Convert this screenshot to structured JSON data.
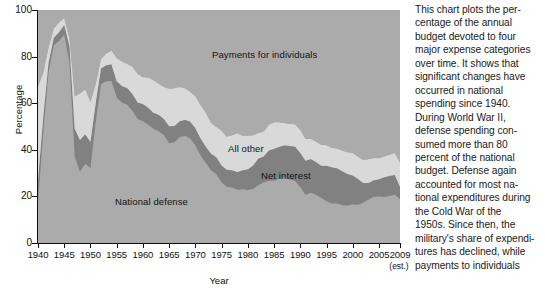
{
  "chart_data": {
    "type": "area",
    "stacked": true,
    "title": "",
    "xlabel": "Year",
    "ylabel": "Percentage",
    "xlim": [
      1940,
      2009
    ],
    "ylim": [
      0,
      100
    ],
    "grid": false,
    "legend_position": "inline-band-labels",
    "y_ticks": [
      0,
      20,
      40,
      60,
      80,
      100
    ],
    "x_ticks": [
      1940,
      1945,
      1950,
      1955,
      1960,
      1965,
      1970,
      1975,
      1980,
      1985,
      1990,
      1995,
      2000,
      2005,
      2009
    ],
    "x_last_tick_note": "(est.)",
    "x": [
      1940,
      1941,
      1942,
      1943,
      1944,
      1945,
      1946,
      1947,
      1948,
      1949,
      1950,
      1951,
      1952,
      1953,
      1954,
      1955,
      1956,
      1957,
      1958,
      1959,
      1960,
      1961,
      1962,
      1963,
      1964,
      1965,
      1966,
      1967,
      1968,
      1969,
      1970,
      1971,
      1972,
      1973,
      1974,
      1975,
      1976,
      1977,
      1978,
      1979,
      1980,
      1981,
      1982,
      1983,
      1984,
      1985,
      1986,
      1987,
      1988,
      1989,
      1990,
      1991,
      1992,
      1993,
      1994,
      1995,
      1996,
      1997,
      1998,
      1999,
      2000,
      2001,
      2002,
      2003,
      2004,
      2005,
      2006,
      2007,
      2008,
      2009
    ],
    "series": [
      {
        "name": "National defense",
        "color": "#ababab",
        "order": 1,
        "values": [
          17.5,
          47.1,
          73.0,
          84.9,
          86.7,
          89.5,
          77.3,
          37.1,
          30.6,
          33.9,
          32.2,
          51.8,
          68.1,
          69.4,
          69.5,
          62.4,
          60.2,
          59.3,
          56.8,
          53.2,
          52.2,
          50.8,
          49.0,
          48.0,
          46.2,
          42.8,
          43.2,
          45.4,
          46.0,
          44.9,
          41.8,
          37.5,
          34.3,
          31.2,
          29.5,
          26.0,
          24.1,
          23.8,
          22.8,
          23.1,
          22.7,
          23.2,
          24.9,
          26.0,
          26.7,
          26.7,
          27.6,
          28.1,
          27.3,
          26.6,
          23.9,
          20.6,
          21.6,
          20.7,
          19.3,
          17.9,
          17.0,
          16.9,
          16.2,
          16.1,
          16.5,
          16.4,
          17.3,
          18.7,
          19.9,
          20.0,
          19.7,
          20.2,
          20.7,
          18.8
        ]
      },
      {
        "name": "Net interest",
        "color": "#818181",
        "order": 2,
        "values": [
          9.5,
          7.0,
          4.3,
          3.2,
          3.8,
          4.1,
          7.3,
          11.9,
          13.6,
          12.8,
          11.3,
          8.4,
          6.8,
          6.9,
          7.2,
          7.0,
          7.2,
          7.2,
          7.1,
          7.1,
          7.5,
          7.2,
          6.9,
          7.0,
          7.0,
          7.3,
          7.0,
          6.9,
          6.9,
          7.2,
          7.4,
          7.3,
          7.0,
          7.1,
          7.3,
          7.3,
          7.3,
          7.4,
          7.7,
          8.1,
          8.9,
          10.1,
          11.4,
          11.1,
          13.0,
          13.7,
          13.7,
          13.8,
          14.3,
          14.8,
          14.7,
          14.7,
          14.4,
          14.1,
          13.9,
          15.3,
          15.5,
          15.2,
          14.6,
          13.5,
          12.5,
          11.1,
          8.5,
          7.1,
          7.0,
          7.4,
          8.5,
          8.7,
          8.5,
          5.3
        ]
      },
      {
        "name": "All other",
        "color": "#d9d9d9",
        "order": 3,
        "values": [
          40.2,
          19.0,
          6.5,
          4.0,
          4.1,
          3.0,
          3.2,
          14.0,
          20.0,
          19.3,
          17.0,
          8.0,
          4.0,
          5.0,
          5.8,
          10.0,
          10.5,
          10.3,
          11.7,
          12.2,
          11.4,
          13.0,
          14.0,
          13.3,
          13.8,
          16.1,
          16.2,
          14.6,
          13.5,
          12.8,
          13.8,
          14.3,
          14.6,
          13.2,
          13.0,
          14.9,
          14.2,
          15.0,
          16.6,
          14.8,
          14.4,
          12.9,
          10.9,
          10.7,
          11.1,
          11.4,
          10.5,
          9.6,
          9.5,
          9.6,
          9.9,
          9.3,
          8.6,
          8.7,
          9.0,
          8.7,
          8.3,
          8.5,
          8.8,
          9.3,
          9.6,
          9.5,
          9.8,
          10.1,
          9.6,
          9.0,
          8.9,
          9.0,
          9.4,
          10.5
        ]
      },
      {
        "name": "Payments for individuals",
        "color": "#ababab",
        "order": 4,
        "values": [
          32.8,
          26.9,
          16.2,
          7.9,
          5.4,
          3.4,
          12.2,
          37.0,
          35.8,
          34.0,
          39.5,
          31.8,
          21.1,
          18.7,
          17.5,
          20.6,
          22.1,
          23.2,
          24.4,
          27.5,
          28.9,
          29.0,
          30.1,
          31.7,
          33.0,
          33.8,
          33.6,
          33.1,
          33.6,
          35.1,
          37.0,
          40.9,
          44.1,
          48.5,
          50.2,
          51.8,
          54.4,
          53.8,
          52.9,
          54.0,
          54.0,
          53.8,
          52.8,
          52.2,
          49.2,
          48.2,
          48.2,
          48.5,
          48.9,
          49.0,
          51.5,
          55.4,
          55.4,
          56.5,
          57.8,
          58.1,
          59.2,
          59.4,
          60.4,
          61.1,
          61.4,
          63.0,
          64.4,
          64.1,
          63.5,
          63.6,
          62.9,
          62.1,
          61.4,
          65.4
        ]
      }
    ]
  },
  "axis": {
    "y_label": "Percentage",
    "x_label": "Year",
    "y_ticks": [
      "0",
      "20",
      "40",
      "60",
      "80",
      "100"
    ],
    "x_ticks": [
      "1940",
      "1945",
      "1950",
      "1955",
      "1960",
      "1965",
      "1970",
      "1975",
      "1980",
      "1985",
      "1990",
      "1995",
      "2000",
      "2005",
      "2009"
    ],
    "x_last_sub": "(est.)"
  },
  "band_labels": {
    "payments": "Payments for individuals",
    "all_other": "All other",
    "net_interest": "Net interest",
    "national_defense": "National defense"
  },
  "caption": {
    "lines": [
      "This chart plots the per-",
      "centage of the annual",
      "budget devoted to four",
      "major expense categories",
      "over time. It shows that",
      "significant changes have",
      "occurred in national",
      "spending since 1940.",
      "During World War II,",
      "defense spending con-",
      "sumed more than 80",
      "percent of the national",
      "budget. Defense again",
      "accounted for most na-",
      "tional expenditures during",
      "the Cold War of the",
      "1950s. Since then, the",
      "military's share of expendi-",
      "tures has declined, while",
      "payments to individuals"
    ]
  },
  "colors": {
    "plot_background": "#ababab",
    "national_defense": "#ababab",
    "net_interest": "#818181",
    "all_other": "#d9d9d9",
    "payments_for_individuals": "#ababab",
    "axis": "#111111",
    "text": "#1a1a1a",
    "page_background": "#ffffff"
  }
}
